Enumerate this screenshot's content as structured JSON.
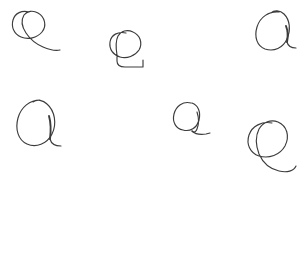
{
  "canvas": {
    "background_color": "#ffffff",
    "ink_color": "#3c3c3c",
    "strokes": [
      {
        "id": "stroke-1",
        "label": "e",
        "bbox": [
          12,
          8,
          48,
          52
        ],
        "description": "handwritten lowercase e, small, upper-left"
      },
      {
        "id": "stroke-2",
        "label": "e",
        "bbox": [
          108,
          30,
          148,
          68
        ],
        "description": "handwritten lowercase e with long flat tail, upper-middle"
      },
      {
        "id": "stroke-3",
        "label": "a",
        "bbox": [
          255,
          10,
          296,
          52
        ],
        "description": "handwritten lowercase a, closed loop with right stem, upper-right"
      },
      {
        "id": "stroke-4",
        "label": "a",
        "bbox": [
          16,
          98,
          62,
          148
        ],
        "description": "handwritten lowercase a, large closed loop, lower-left"
      },
      {
        "id": "stroke-5",
        "label": "a",
        "bbox": [
          172,
          100,
          212,
          136
        ],
        "description": "handwritten lowercase a, small, lower-middle"
      },
      {
        "id": "stroke-6",
        "label": "e",
        "bbox": [
          246,
          120,
          298,
          172
        ],
        "description": "handwritten lowercase e, large, lower-right"
      }
    ]
  },
  "templates": {
    "label": "Templates:",
    "label_color": "#5b5b5b",
    "glyph_color": "#6e6e6e",
    "columns": 5,
    "rows": [
      {
        "character": "e",
        "glyphs": [
          "e",
          "e",
          "e",
          "e",
          "e"
        ]
      },
      {
        "character": "a",
        "glyphs": [
          "a",
          "a",
          "a",
          "a",
          "a"
        ]
      }
    ],
    "styles": [
      "s-sans",
      "s-dejavu",
      "s-serif",
      "s-mono",
      "s-italic"
    ]
  }
}
